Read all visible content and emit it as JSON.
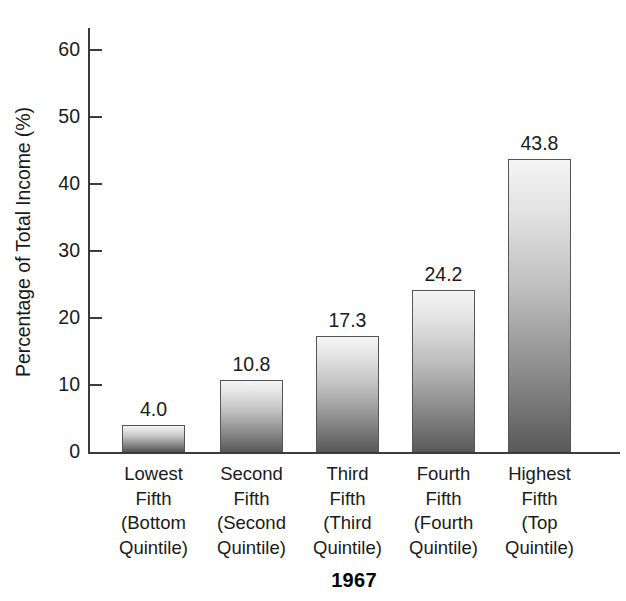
{
  "chart_data": {
    "type": "bar",
    "title": "1967",
    "xlabel": "",
    "ylabel": "Percentage of Total Income (%)",
    "ylim": [
      0,
      63
    ],
    "yticks": [
      0,
      10,
      20,
      30,
      40,
      50,
      60
    ],
    "ytick_labels": [
      "0",
      "10",
      "20",
      "30",
      "40",
      "50",
      "60"
    ],
    "grid": false,
    "legend": false,
    "categories": [
      "Lowest Fifth (Bottom Quintile)",
      "Second Fifth (Second Quintile)",
      "Third Fifth (Third Quintile)",
      "Fourth Fifth (Fourth Quintile)",
      "Highest Fifth (Top Quintile)"
    ],
    "category_lines": [
      [
        "Lowest",
        "Fifth",
        "(Bottom",
        "Quintile)"
      ],
      [
        "Second",
        "Fifth",
        "(Second",
        "Quintile)"
      ],
      [
        "Third",
        "Fifth",
        "(Third",
        "Quintile)"
      ],
      [
        "Fourth",
        "Fifth",
        "(Fourth",
        "Quintile)"
      ],
      [
        "Highest",
        "Fifth",
        "(Top",
        "Quintile)"
      ]
    ],
    "values": [
      4.0,
      10.8,
      17.3,
      24.2,
      43.8
    ],
    "value_labels": [
      "4.0",
      "10.8",
      "17.3",
      "24.2",
      "43.8"
    ],
    "bar_style": {
      "fill": "vertical-gradient-gray",
      "gradient_top": "#f4f4f4",
      "gradient_bottom": "#5a5a5a",
      "border": "#555555"
    },
    "axis_color": "#3b3b3b",
    "text_color": "#1a1a1a",
    "background": "#ffffff"
  }
}
